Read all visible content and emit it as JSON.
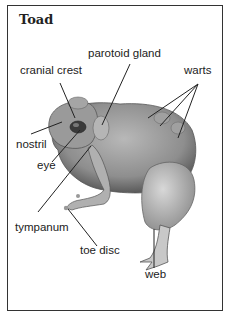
{
  "figure": {
    "title": "Toad",
    "labels": {
      "parotoid_gland": "parotoid gland",
      "cranial_crest": "cranial crest",
      "warts": "warts",
      "nostril": "nostril",
      "eye": "eye",
      "tympanum": "tympanum",
      "toe_disc": "toe disc",
      "web": "web"
    }
  }
}
